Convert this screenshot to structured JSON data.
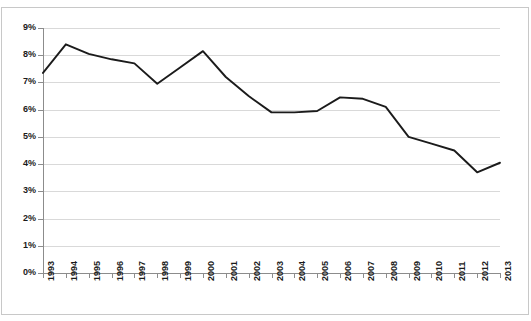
{
  "chart_data": {
    "type": "line",
    "title": "",
    "xlabel": "",
    "ylabel": "",
    "categories": [
      "1993",
      "1994",
      "1995",
      "1996",
      "1997",
      "1998",
      "1999",
      "2000",
      "2001",
      "2002",
      "2003",
      "2004",
      "2005",
      "2006",
      "2007",
      "2008",
      "2009",
      "2010",
      "2011",
      "2012",
      "2013"
    ],
    "values": [
      7.35,
      8.4,
      8.05,
      7.85,
      7.7,
      6.95,
      7.55,
      8.15,
      7.2,
      6.5,
      5.9,
      5.9,
      5.95,
      6.45,
      6.4,
      6.1,
      5.0,
      4.75,
      4.5,
      3.7,
      4.05
    ],
    "series": [
      {
        "name": "",
        "values": [
          7.35,
          8.4,
          8.05,
          7.85,
          7.7,
          6.95,
          7.55,
          8.15,
          7.2,
          6.5,
          5.9,
          5.9,
          5.95,
          6.45,
          6.4,
          6.1,
          5.0,
          4.75,
          4.5,
          3.7,
          4.05
        ]
      }
    ],
    "ylim": [
      0,
      9
    ],
    "ytick_values": [
      0,
      1,
      2,
      3,
      4,
      5,
      6,
      7,
      8,
      9
    ],
    "ytick_labels": [
      "0%",
      "1%",
      "2%",
      "3%",
      "4%",
      "5%",
      "6%",
      "7%",
      "8%",
      "9%"
    ],
    "grid": true,
    "grid_axis": "y",
    "legend": false,
    "legend_position": "none",
    "line_color": "#1b1b1b",
    "grid_color": "#d9d9d9",
    "axis_color": "#8c8c8c",
    "background_color": "#ffffff",
    "border_color": "#c8c8c8",
    "xtick_rotation": 90
  }
}
